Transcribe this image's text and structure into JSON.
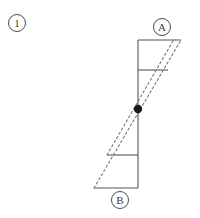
{
  "figure": {
    "index_label": "①",
    "index_char": "1",
    "node_a_label": "A",
    "node_b_label": "B",
    "colors": {
      "solid_line": "#555555",
      "dashed_line": "#777777",
      "joint_dot": "#1a1a1a",
      "label_text": "#3a3a3a",
      "background": "#ffffff"
    },
    "geometry": {
      "column_top_y": 40,
      "column_bottom_y": 188,
      "column_x": 138,
      "joint_x": 138,
      "joint_y": 109,
      "joint_radius": 4.2,
      "top_beam_x_start": 138,
      "top_beam_x_end": 181,
      "upper_beam_y": 70,
      "upper_beam_x_end": 168,
      "lower_beam_y": 155,
      "lower_beam_x_start": 107,
      "bottom_beam_x_start": 94,
      "bottom_beam_y": 188
    },
    "dashed_paths": [
      {
        "name": "deformed-outline-outer",
        "x1": 94,
        "y1": 188,
        "x2": 181,
        "y2": 40
      },
      {
        "name": "deformed-outline-inner",
        "x1": 107,
        "y1": 155,
        "x2": 173,
        "y2": 41
      }
    ],
    "caption_top": ""
  }
}
